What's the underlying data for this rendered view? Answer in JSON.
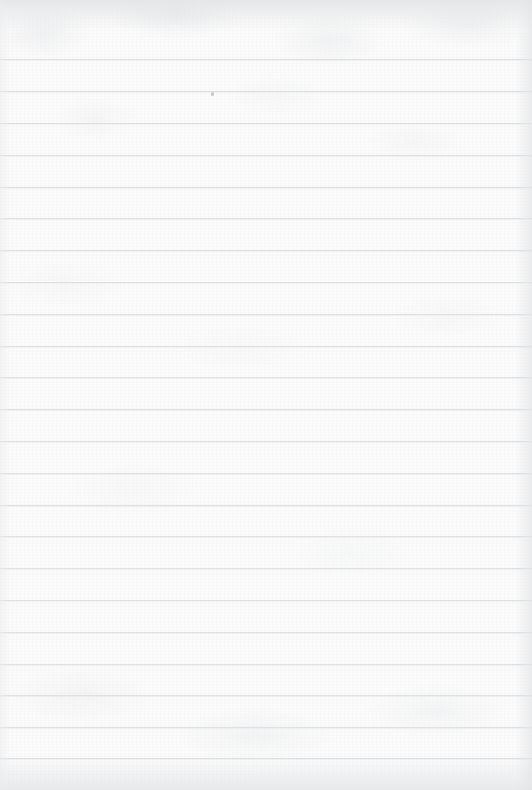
{
  "document": {
    "type": "scanned-ruled-paper",
    "title": "Blank ruled notebook page",
    "content_text": "",
    "handwriting_present": "no",
    "printed_text_present": "no"
  },
  "page": {
    "width_px": 532,
    "height_px": 790,
    "paper_color": "#fbfbfb",
    "rule_color": "#dcdee1",
    "margin_shadow_color": "#e4e6e8",
    "orientation": "portrait"
  },
  "ruling": {
    "style": "horizontal-feint-rules",
    "line_count": 23,
    "first_line_y": 59,
    "line_spacing_px": 31.7,
    "line_thickness_px": 1,
    "left_inset_px": 0,
    "right_inset_px": 0,
    "has_vertical_margin_rule": "no",
    "line_y_positions": [
      59,
      91,
      123,
      155,
      187,
      218,
      250,
      282,
      314,
      346,
      377,
      409,
      441,
      473,
      505,
      536,
      568,
      600,
      632,
      664,
      695,
      727,
      758
    ]
  },
  "margins": {
    "top_margin_px": 59,
    "bottom_margin_px": 32,
    "top_edge_shade": "#dee0e2",
    "bottom_edge_shade": "#e4e6e8",
    "right_edge_shade": "#e2e4e6",
    "left_edge_shade": "#ebeced"
  },
  "artifacts": {
    "specks": [
      {
        "name": "speck-1",
        "x": 211,
        "y": 92,
        "color": "#b9bcc1"
      }
    ],
    "description": "single faint dust speck near the second rule line"
  },
  "lines": [
    {
      "index": 1,
      "y": 59,
      "text": ""
    },
    {
      "index": 2,
      "y": 91,
      "text": ""
    },
    {
      "index": 3,
      "y": 123,
      "text": ""
    },
    {
      "index": 4,
      "y": 155,
      "text": ""
    },
    {
      "index": 5,
      "y": 187,
      "text": ""
    },
    {
      "index": 6,
      "y": 218,
      "text": ""
    },
    {
      "index": 7,
      "y": 250,
      "text": ""
    },
    {
      "index": 8,
      "y": 282,
      "text": ""
    },
    {
      "index": 9,
      "y": 314,
      "text": ""
    },
    {
      "index": 10,
      "y": 346,
      "text": ""
    },
    {
      "index": 11,
      "y": 377,
      "text": ""
    },
    {
      "index": 12,
      "y": 409,
      "text": ""
    },
    {
      "index": 13,
      "y": 441,
      "text": ""
    },
    {
      "index": 14,
      "y": 473,
      "text": ""
    },
    {
      "index": 15,
      "y": 505,
      "text": ""
    },
    {
      "index": 16,
      "y": 536,
      "text": ""
    },
    {
      "index": 17,
      "y": 568,
      "text": ""
    },
    {
      "index": 18,
      "y": 600,
      "text": ""
    },
    {
      "index": 19,
      "y": 632,
      "text": ""
    },
    {
      "index": 20,
      "y": 664,
      "text": ""
    },
    {
      "index": 21,
      "y": 695,
      "text": ""
    },
    {
      "index": 22,
      "y": 727,
      "text": ""
    },
    {
      "index": 23,
      "y": 758,
      "text": ""
    }
  ]
}
